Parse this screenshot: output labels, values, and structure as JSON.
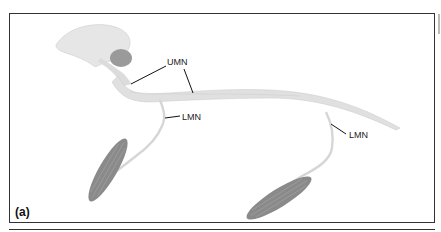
{
  "figure": {
    "panel_label": "(a)",
    "labels": {
      "umn": "UMN",
      "lmn_upper": "LMN",
      "lmn_lower": "LMN"
    },
    "colors": {
      "brain": "#e4e4e4",
      "cerebellum": "#9a9a9a",
      "spinal_cord": "#dedede",
      "nerve": "#d8d8d8",
      "muscle": "#8a8a8a",
      "leader_line": "#111111",
      "frame": "#333333"
    }
  }
}
